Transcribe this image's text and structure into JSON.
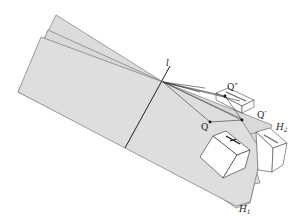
{
  "figure": {
    "labels": {
      "line": "l",
      "point_q": "Q",
      "point_q_prime": "Q′",
      "point_q_double_prime": "Q″",
      "plane_1": "H",
      "plane_1_sub": "1",
      "plane_2": "H",
      "plane_2_sub": "2"
    },
    "colors": {
      "plane_fill": "#dcdcdc",
      "edge": "#555555",
      "line": "#222222",
      "box_fill": "#ffffff"
    }
  }
}
